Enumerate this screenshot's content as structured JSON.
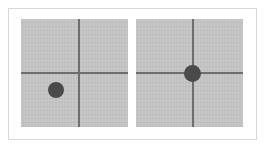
{
  "figure": {
    "canvas": {
      "width": 266,
      "height": 148,
      "background": "#ffffff"
    },
    "frame": {
      "border_color": "#d8d8d8",
      "border_width": 1
    },
    "colors": {
      "panel_fill": "#c3c3c3",
      "crosshair": "#6e6e6e",
      "dot": "#4a4a4a",
      "frame_border": "#d8d8d8",
      "canvas_background": "#ffffff"
    },
    "caption": "",
    "title": ""
  },
  "panels": [
    {
      "id": "panel-left",
      "name": "left-panel",
      "label": "",
      "description": "Gray square with crosshair; dark target dot offset into the lower-left quadrant, not aligned with the crosshair intersection.",
      "alignment_state": "misaligned",
      "crosshair": {
        "vertical_x_pct": 54,
        "horizontal_y_pct": 50,
        "line_thickness_px": 2,
        "color": "#6e6e6e"
      },
      "dot": {
        "center_x_pct": 33,
        "center_y_pct": 66,
        "diameter_px": 16,
        "color": "#4a4a4a",
        "on_crosshair": false
      }
    },
    {
      "id": "panel-right",
      "name": "right-panel",
      "label": "",
      "description": "Gray square with centered crosshair; dark target dot sits exactly on the crosshair intersection.",
      "alignment_state": "aligned",
      "crosshair": {
        "vertical_x_pct": 53,
        "horizontal_y_pct": 50,
        "line_thickness_px": 2,
        "color": "#6e6e6e"
      },
      "dot": {
        "center_x_pct": 53,
        "center_y_pct": 50,
        "diameter_px": 17,
        "color": "#4a4a4a",
        "on_crosshair": true
      }
    }
  ]
}
